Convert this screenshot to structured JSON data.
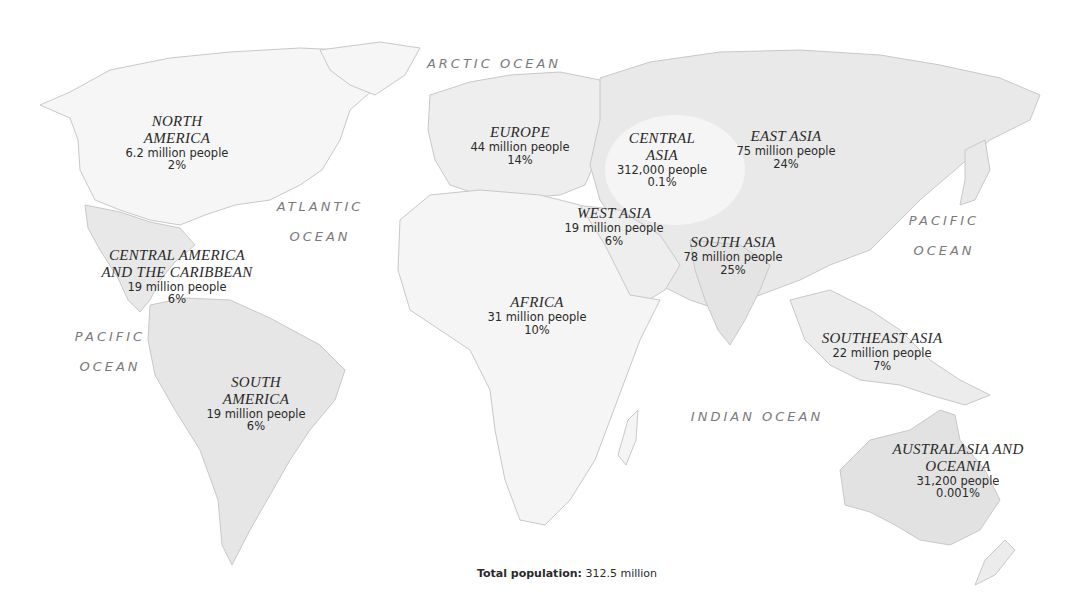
{
  "map": {
    "type": "world population distribution map",
    "colors": {
      "background": "#ffffff",
      "land_light": "#f4f4f4",
      "land_shaded": "#e6e6e6",
      "coastline": "#c8c8c8",
      "region_label": "#2a2a2a",
      "ocean_label": "#7a7a7a"
    }
  },
  "oceans": {
    "arctic": {
      "line1": "ARCTIC OCEAN"
    },
    "atlantic": {
      "line1": "ATLANTIC",
      "line2": "OCEAN"
    },
    "pacific_west": {
      "line1": "PACIFIC",
      "line2": "OCEAN"
    },
    "pacific_east": {
      "line1": "PACIFIC",
      "line2": "OCEAN"
    },
    "indian": {
      "line1": "INDIAN OCEAN"
    }
  },
  "regions": [
    {
      "name1": "NORTH",
      "name2": "AMERICA",
      "population": "6.2 million people",
      "percent": "2%"
    },
    {
      "name1": "CENTRAL AMERICA",
      "name2": "AND THE CARIBBEAN",
      "population": "19 million people",
      "percent": "6%"
    },
    {
      "name1": "SOUTH",
      "name2": "AMERICA",
      "population": "19 million people",
      "percent": "6%"
    },
    {
      "name1": "EUROPE",
      "population": "44 million people",
      "percent": "14%"
    },
    {
      "name1": "CENTRAL",
      "name2": "ASIA",
      "population": "312,000 people",
      "percent": "0.1%"
    },
    {
      "name1": "EAST ASIA",
      "population": "75 million people",
      "percent": "24%"
    },
    {
      "name1": "WEST ASIA",
      "population": "19 million people",
      "percent": "6%"
    },
    {
      "name1": "SOUTH ASIA",
      "population": "78 million people",
      "percent": "25%"
    },
    {
      "name1": "AFRICA",
      "population": "31 million people",
      "percent": "10%"
    },
    {
      "name1": "SOUTHEAST ASIA",
      "population": "22 million people",
      "percent": "7%"
    },
    {
      "name1": "AUSTRALASIA AND",
      "name2": "OCEANIA",
      "population": "31,200 people",
      "percent": "0.001%"
    }
  ],
  "footer": {
    "total_label": "Total population:",
    "total_value": " 312.5 million"
  }
}
